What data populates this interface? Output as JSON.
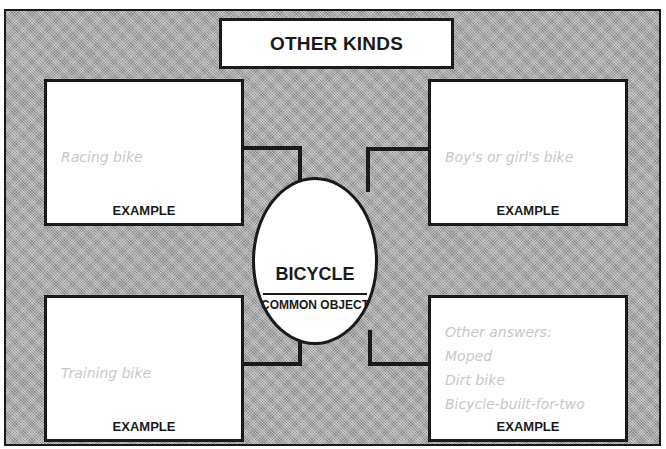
{
  "header": {
    "title": "OTHER KINDS"
  },
  "center": {
    "title": "BICYCLE",
    "subtitle": "COMMON OBJECT"
  },
  "examples": [
    {
      "position": "top-left",
      "label": "EXAMPLE",
      "answer": "Racing bike"
    },
    {
      "position": "top-right",
      "label": "EXAMPLE",
      "answer": "Boy's or girl's bike"
    },
    {
      "position": "bottom-left",
      "label": "EXAMPLE",
      "answer": "Training bike"
    },
    {
      "position": "bottom-right",
      "label": "EXAMPLE",
      "answers": [
        "Other answers:",
        "Moped",
        "Dirt bike",
        "Bicycle-built-for-two"
      ]
    }
  ],
  "colors": {
    "background_pattern": "#a9a9a9",
    "line": "#1a1a1a",
    "box_fill": "#ffffff",
    "answer_text": "#c8c8c8"
  }
}
